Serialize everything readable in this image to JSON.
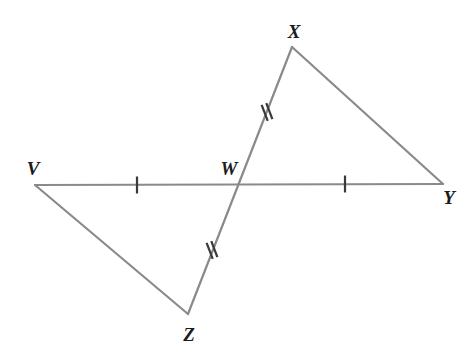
{
  "figure": {
    "type": "geometry-diagram",
    "width": 469,
    "height": 353,
    "background_color": "#ffffff",
    "line_color": "#8a8a8a",
    "tick_color": "#3a3a3a",
    "label_color": "#1b1b1b",
    "line_width": 2.2,
    "points": {
      "V": {
        "label": "V",
        "x": 35,
        "y": 185,
        "label_x": 33,
        "label_y": 168
      },
      "W": {
        "label": "W",
        "x": 240,
        "y": 185,
        "label_x": 229,
        "label_y": 168
      },
      "X": {
        "label": "X",
        "x": 292,
        "y": 47,
        "label_x": 294,
        "label_y": 31
      },
      "Y": {
        "label": "Y",
        "x": 443,
        "y": 184,
        "label_x": 449,
        "label_y": 197
      },
      "Z": {
        "label": "Z",
        "x": 188,
        "y": 314,
        "label_x": 189,
        "label_y": 334
      }
    },
    "segments": [
      {
        "name": "segment-VY",
        "from": "V",
        "to": "Y",
        "x1": 35,
        "y1": 185,
        "x2": 443,
        "y2": 184
      },
      {
        "name": "segment-XZ",
        "from": "X",
        "to": "Z",
        "x1": 292,
        "y1": 47,
        "x2": 188,
        "y2": 314
      },
      {
        "name": "segment-VZ",
        "from": "V",
        "to": "Z",
        "x1": 35,
        "y1": 185,
        "x2": 188,
        "y2": 314
      },
      {
        "name": "segment-XY",
        "from": "X",
        "to": "Y",
        "x1": 292,
        "y1": 47,
        "x2": 443,
        "y2": 184
      }
    ],
    "tick_marks": [
      {
        "name": "tick-segment-VW",
        "on_segment": "VW",
        "count": 1,
        "x": 137,
        "y": 185,
        "angle": 0,
        "length": 17
      },
      {
        "name": "tick-segment-WY",
        "on_segment": "WY",
        "count": 1,
        "x": 345,
        "y": 184,
        "angle": 0,
        "length": 17
      },
      {
        "name": "tick-segment-WX",
        "on_segment": "WX",
        "count": 2,
        "x": 267,
        "y": 112,
        "angle": -21,
        "length": 17
      },
      {
        "name": "tick-segment-WZ",
        "on_segment": "WZ",
        "count": 2,
        "x": 212,
        "y": 250,
        "angle": -21,
        "length": 17
      }
    ]
  }
}
